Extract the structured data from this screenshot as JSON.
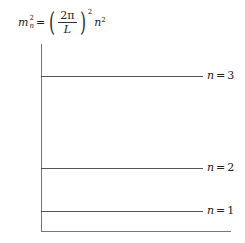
{
  "formula": {
    "lhs_var": "m",
    "lhs_sub": "n",
    "lhs_sup": "2",
    "equals": "=",
    "numerator": "2π",
    "denominator": "L",
    "paren_sup": "2",
    "rhs_var": "n",
    "rhs_sup": "2"
  },
  "levels": [
    {
      "var": "n",
      "equals": "=",
      "value": "3",
      "y": 76
    },
    {
      "var": "n",
      "equals": "=",
      "value": "2",
      "y": 168
    },
    {
      "var": "n",
      "equals": "=",
      "value": "1",
      "y": 211
    }
  ],
  "axis": {
    "baseline_y": 231
  }
}
